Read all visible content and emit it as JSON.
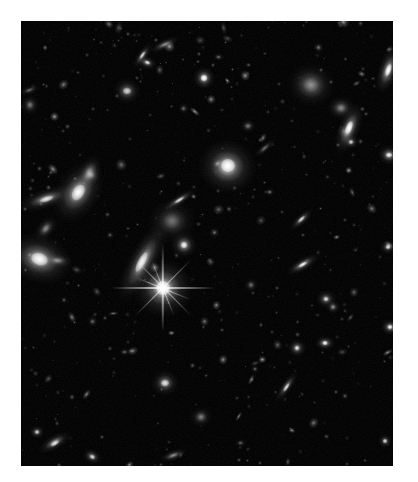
{
  "image": {
    "kind": "astronomical-deep-field-photograph",
    "subject": "deep field of distant galaxies and foreground stars",
    "frame": {
      "canvas_width": 418,
      "canvas_height": 482,
      "border_color": "#ffffff",
      "field_left": 21,
      "field_top": 21,
      "field_width": 372,
      "field_height": 445,
      "sky_color": "#030303"
    },
    "caption": "",
    "title": "",
    "labels": [],
    "annotations": []
  },
  "objects": [
    {
      "name": "bright-star-with-diffraction-spikes",
      "x": 163,
      "y": 288,
      "w": 26,
      "h": 26,
      "rot": 0,
      "core": 1.0,
      "color": "#ffffff",
      "type": "star"
    },
    {
      "name": "edge-on-spiral-galaxy-center",
      "x": 142,
      "y": 262,
      "w": 13,
      "h": 40,
      "rot": 28,
      "core": 0.8,
      "color": "#f2f2f2",
      "type": "spiral"
    },
    {
      "name": "bright-elliptical-galaxy-upper-center",
      "x": 228,
      "y": 166,
      "w": 26,
      "h": 24,
      "rot": 10,
      "core": 0.95,
      "color": "#ffffff",
      "type": "elliptical"
    },
    {
      "name": "large-spiral-galaxy-left-edge",
      "x": 39,
      "y": 259,
      "w": 30,
      "h": 22,
      "rot": 18,
      "core": 0.88,
      "core_spot": true,
      "color": "#fafafa",
      "type": "spiral"
    },
    {
      "name": "companion-knot-left-edge",
      "x": 57,
      "y": 261,
      "w": 14,
      "h": 7,
      "rot": 5,
      "core": 0.55,
      "color": "#d8d8d8",
      "type": "knot"
    },
    {
      "name": "inclined-spiral-galaxy-left",
      "x": 78,
      "y": 192,
      "w": 20,
      "h": 30,
      "rot": 32,
      "core": 0.85,
      "color": "#ffffff",
      "type": "spiral"
    },
    {
      "name": "edge-on-streak-galaxy-left",
      "x": 46,
      "y": 199,
      "w": 9,
      "h": 26,
      "rot": 72,
      "core": 0.7,
      "color": "#e8e8e8",
      "type": "edge-on"
    },
    {
      "name": "small-spiral-left-upper",
      "x": 89,
      "y": 173,
      "w": 10,
      "h": 18,
      "rot": 25,
      "core": 0.58,
      "color": "#cfcfcf",
      "type": "spiral"
    },
    {
      "name": "faint-elliptical-left",
      "x": 91,
      "y": 175,
      "w": 9,
      "h": 9,
      "rot": 0,
      "core": 0.5,
      "color": "#bdbdbd",
      "type": "elliptical"
    },
    {
      "name": "compact-galaxy-left-mid",
      "x": 46,
      "y": 228,
      "w": 8,
      "h": 13,
      "rot": 40,
      "core": 0.55,
      "color": "#c6c6c6",
      "type": "compact"
    },
    {
      "name": "diffuse-irregular-galaxy-center",
      "x": 172,
      "y": 221,
      "w": 22,
      "h": 20,
      "rot": 0,
      "core": 0.45,
      "color": "#c9c9c9",
      "type": "irregular"
    },
    {
      "name": "compact-bright-galaxy-center",
      "x": 184,
      "y": 245,
      "w": 12,
      "h": 12,
      "rot": 0,
      "core": 0.78,
      "color": "#f0f0f0",
      "type": "compact"
    },
    {
      "name": "edge-on-needle-galaxy-center",
      "x": 179,
      "y": 200,
      "w": 5,
      "h": 18,
      "rot": 58,
      "core": 0.62,
      "color": "#dadada",
      "type": "edge-on"
    },
    {
      "name": "star-upper-center",
      "x": 204,
      "y": 78,
      "w": 10,
      "h": 10,
      "rot": 0,
      "core": 0.92,
      "color": "#ffffff",
      "type": "star"
    },
    {
      "name": "fuzzy-galaxy-upper-center",
      "x": 127,
      "y": 91,
      "w": 13,
      "h": 12,
      "rot": 0,
      "core": 0.6,
      "color": "#d2d2d2",
      "type": "elliptical"
    },
    {
      "name": "bright-knot-upper-left",
      "x": 147,
      "y": 63,
      "w": 9,
      "h": 6,
      "rot": 20,
      "core": 0.7,
      "color": "#e4e4e4",
      "type": "knot"
    },
    {
      "name": "elongated-galaxy-upper-left",
      "x": 142,
      "y": 55,
      "w": 5,
      "h": 14,
      "rot": 35,
      "core": 0.6,
      "color": "#d6d6d6",
      "type": "edge-on"
    },
    {
      "name": "streak-galaxy-upper-left",
      "x": 164,
      "y": 44,
      "w": 5,
      "h": 15,
      "rot": 65,
      "core": 0.55,
      "color": "#cccccc",
      "type": "edge-on"
    },
    {
      "name": "irregular-galaxy-upper-right",
      "x": 311,
      "y": 85,
      "w": 22,
      "h": 20,
      "rot": 15,
      "core": 0.58,
      "color": "#d9d9d9",
      "type": "irregular"
    },
    {
      "name": "bright-edge-on-galaxy-upper-right",
      "x": 388,
      "y": 70,
      "w": 9,
      "h": 22,
      "rot": 18,
      "core": 0.9,
      "color": "#ffffff",
      "type": "edge-on"
    },
    {
      "name": "bright-edge-on-galaxy-right",
      "x": 349,
      "y": 128,
      "w": 10,
      "h": 24,
      "rot": 22,
      "core": 0.92,
      "color": "#ffffff",
      "type": "edge-on"
    },
    {
      "name": "knot-below-right-galaxy",
      "x": 351,
      "y": 142,
      "w": 7,
      "h": 6,
      "rot": 0,
      "core": 0.6,
      "color": "#cdcdcd",
      "type": "knot"
    },
    {
      "name": "fuzzy-galaxy-right",
      "x": 341,
      "y": 108,
      "w": 13,
      "h": 11,
      "rot": 0,
      "core": 0.55,
      "color": "#c9c9c9",
      "type": "elliptical"
    },
    {
      "name": "bright-knot-far-right",
      "x": 389,
      "y": 155,
      "w": 10,
      "h": 9,
      "rot": 0,
      "core": 0.78,
      "color": "#f2f2f2",
      "type": "knot"
    },
    {
      "name": "edge-on-galaxy-right-mid",
      "x": 303,
      "y": 265,
      "w": 6,
      "h": 17,
      "rot": 60,
      "core": 0.75,
      "color": "#efefef",
      "type": "edge-on"
    },
    {
      "name": "edge-on-galaxy-right-upper",
      "x": 301,
      "y": 219,
      "w": 5,
      "h": 14,
      "rot": 48,
      "core": 0.62,
      "color": "#d7d7d7",
      "type": "edge-on"
    },
    {
      "name": "small-galaxy-right-lower",
      "x": 326,
      "y": 299,
      "w": 9,
      "h": 8,
      "rot": 0,
      "core": 0.66,
      "color": "#e0e0e0",
      "type": "compact"
    },
    {
      "name": "knot-pair-right-lower",
      "x": 333,
      "y": 307,
      "w": 6,
      "h": 6,
      "rot": 0,
      "core": 0.58,
      "color": "#cfcfcf",
      "type": "knot"
    },
    {
      "name": "streak-galaxy-center-lower",
      "x": 286,
      "y": 387,
      "w": 5,
      "h": 16,
      "rot": 35,
      "core": 0.65,
      "color": "#dddddd",
      "type": "edge-on"
    },
    {
      "name": "bright-knot-center-lower",
      "x": 325,
      "y": 343,
      "w": 9,
      "h": 6,
      "rot": 0,
      "core": 0.82,
      "color": "#f6f6f6",
      "type": "knot"
    },
    {
      "name": "double-knot-lower-center",
      "x": 297,
      "y": 348,
      "w": 8,
      "h": 8,
      "rot": 0,
      "core": 0.72,
      "color": "#eaeaea",
      "type": "knot"
    },
    {
      "name": "compact-galaxy-lower-center",
      "x": 165,
      "y": 383,
      "w": 13,
      "h": 12,
      "rot": 0,
      "core": 0.68,
      "color": "#e3e3e3",
      "type": "compact"
    },
    {
      "name": "faint-galaxy-lower-center-2",
      "x": 201,
      "y": 417,
      "w": 10,
      "h": 9,
      "rot": 0,
      "core": 0.52,
      "color": "#c2c2c2",
      "type": "elliptical"
    },
    {
      "name": "edge-on-galaxy-lower-left",
      "x": 55,
      "y": 443,
      "w": 7,
      "h": 16,
      "rot": 60,
      "core": 0.7,
      "color": "#e6e6e6",
      "type": "edge-on"
    },
    {
      "name": "knot-lower-left-corner",
      "x": 92,
      "y": 457,
      "w": 9,
      "h": 7,
      "rot": 25,
      "core": 0.62,
      "color": "#d4d4d4",
      "type": "knot"
    },
    {
      "name": "knot-lower-left-edge",
      "x": 37,
      "y": 432,
      "w": 7,
      "h": 6,
      "rot": 0,
      "core": 0.6,
      "color": "#d0d0d0",
      "type": "knot"
    },
    {
      "name": "streak-galaxy-bottom",
      "x": 173,
      "y": 455,
      "w": 5,
      "h": 13,
      "rot": 70,
      "core": 0.58,
      "color": "#cbcbcb",
      "type": "edge-on"
    },
    {
      "name": "knot-bottom-right",
      "x": 385,
      "y": 441,
      "w": 6,
      "h": 6,
      "rot": 0,
      "core": 0.62,
      "color": "#d2d2d2",
      "type": "knot"
    },
    {
      "name": "star-right-edge",
      "x": 390,
      "y": 327,
      "w": 8,
      "h": 7,
      "rot": 0,
      "core": 0.8,
      "color": "#f4f4f4",
      "type": "star"
    },
    {
      "name": "knot-right-edge-mid",
      "x": 388,
      "y": 247,
      "w": 7,
      "h": 6,
      "rot": 0,
      "core": 0.68,
      "color": "#e0e0e0",
      "type": "knot"
    },
    {
      "name": "faint-galaxy-center-right",
      "x": 251,
      "y": 285,
      "w": 6,
      "h": 6,
      "rot": 0,
      "core": 0.45,
      "color": "#b5b5b5",
      "type": "compact"
    },
    {
      "name": "faint-galaxy-center-upper",
      "x": 248,
      "y": 126,
      "w": 7,
      "h": 6,
      "rot": 0,
      "core": 0.48,
      "color": "#bdbdbd",
      "type": "compact"
    },
    {
      "name": "faint-streak-center-upper",
      "x": 264,
      "y": 148,
      "w": 4,
      "h": 12,
      "rot": 50,
      "core": 0.44,
      "color": "#b0b0b0",
      "type": "edge-on"
    },
    {
      "name": "faint-knot-center",
      "x": 214,
      "y": 232,
      "w": 5,
      "h": 5,
      "rot": 0,
      "core": 0.42,
      "color": "#a8a8a8",
      "type": "knot"
    },
    {
      "name": "faint-knot-left-lower",
      "x": 92,
      "y": 321,
      "w": 5,
      "h": 5,
      "rot": 0,
      "core": 0.4,
      "color": "#a0a0a0",
      "type": "knot"
    },
    {
      "name": "faint-knot-lower-mid",
      "x": 124,
      "y": 352,
      "w": 5,
      "h": 4,
      "rot": 0,
      "core": 0.4,
      "color": "#9e9e9e",
      "type": "knot"
    },
    {
      "name": "faint-knot-upper-mid",
      "x": 183,
      "y": 108,
      "w": 5,
      "h": 5,
      "rot": 0,
      "core": 0.42,
      "color": "#a6a6a6",
      "type": "knot"
    },
    {
      "name": "faint-galaxy-upper-far-left",
      "x": 30,
      "y": 105,
      "w": 8,
      "h": 9,
      "rot": 0,
      "core": 0.48,
      "color": "#b8b8b8",
      "type": "elliptical"
    },
    {
      "name": "faint-streak-upper-far-left",
      "x": 29,
      "y": 90,
      "w": 4,
      "h": 10,
      "rot": 70,
      "core": 0.42,
      "color": "#aaaaaa",
      "type": "edge-on"
    },
    {
      "name": "knot-upper-far-right",
      "x": 318,
      "y": 47,
      "w": 5,
      "h": 5,
      "rot": 0,
      "core": 0.46,
      "color": "#b0b0b0",
      "type": "knot"
    },
    {
      "name": "knot-upper-center-2",
      "x": 218,
      "y": 57,
      "w": 5,
      "h": 4,
      "rot": 0,
      "core": 0.44,
      "color": "#adadad",
      "type": "knot"
    },
    {
      "name": "faint-knot-mid-right-1",
      "x": 269,
      "y": 192,
      "w": 5,
      "h": 4,
      "rot": 0,
      "core": 0.42,
      "color": "#a5a5a5",
      "type": "knot"
    },
    {
      "name": "faint-knot-mid-right-2",
      "x": 229,
      "y": 209,
      "w": 4,
      "h": 4,
      "rot": 0,
      "core": 0.38,
      "color": "#9c9c9c",
      "type": "knot"
    },
    {
      "name": "faint-knot-mid-left",
      "x": 110,
      "y": 235,
      "w": 4,
      "h": 4,
      "rot": 0,
      "core": 0.38,
      "color": "#9a9a9a",
      "type": "knot"
    },
    {
      "name": "faint-knot-lower-right-1",
      "x": 255,
      "y": 369,
      "w": 4,
      "h": 4,
      "rot": 0,
      "core": 0.4,
      "color": "#a2a2a2",
      "type": "knot"
    },
    {
      "name": "faint-knot-lower-right-2",
      "x": 345,
      "y": 396,
      "w": 4,
      "h": 4,
      "rot": 0,
      "core": 0.38,
      "color": "#9a9a9a",
      "type": "knot"
    },
    {
      "name": "faint-knot-bottom-center",
      "x": 240,
      "y": 443,
      "w": 5,
      "h": 4,
      "rot": 0,
      "core": 0.42,
      "color": "#a4a4a4",
      "type": "knot"
    },
    {
      "name": "faint-knot-bottom-left",
      "x": 72,
      "y": 397,
      "w": 4,
      "h": 4,
      "rot": 0,
      "core": 0.36,
      "color": "#959595",
      "type": "knot"
    },
    {
      "name": "faint-knot-left-mid-2",
      "x": 64,
      "y": 300,
      "w": 4,
      "h": 4,
      "rot": 0,
      "core": 0.36,
      "color": "#939393",
      "type": "knot"
    }
  ],
  "star_spikes": {
    "star_name": "bright-star-with-diffraction-spikes",
    "center_x": 163,
    "center_y": 288,
    "spikes": [
      {
        "angle": 0,
        "length": 52,
        "thickness": 1.6
      },
      {
        "angle": 90,
        "length": 44,
        "thickness": 1.6
      },
      {
        "angle": 45,
        "length": 40,
        "thickness": 1.3
      },
      {
        "angle": 135,
        "length": 40,
        "thickness": 1.3
      },
      {
        "angle": 22,
        "length": 30,
        "thickness": 1.0
      },
      {
        "angle": 68,
        "length": 30,
        "thickness": 1.0
      }
    ]
  }
}
